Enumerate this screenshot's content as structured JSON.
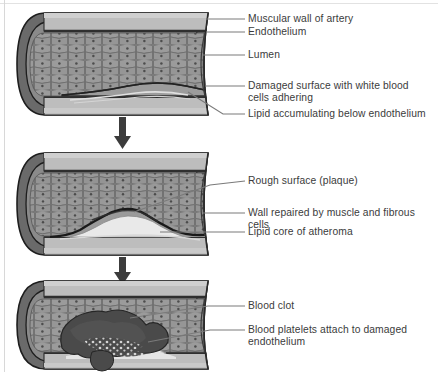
{
  "diagram": {
    "type": "biological-process-diagram",
    "orientation": "vertical-three-stage",
    "colors": {
      "outer_wall_dark": "#5e5e5e",
      "muscular_wall": "#b6b6b6",
      "muscular_wall_light": "#c9c9c9",
      "endothelium_dark": "#3a3a3a",
      "lumen_cells": "#8f8f8f",
      "lumen_cell_outline": "#6d6d6d",
      "lipid_core": "#e6e6e6",
      "blood_clot": "#4a4a4a",
      "platelets": "#d0d0d0",
      "leader_line": "#7a7a7a",
      "text": "#3b3b3b",
      "arrow": "#3c3c3c",
      "background": "#ffffff"
    },
    "stages": [
      {
        "id": "stage-1",
        "order": 1,
        "name": "early-damage",
        "labels": [
          {
            "id": "label-muscular-wall",
            "text": "Muscular wall of artery",
            "x": 248,
            "y": 13
          },
          {
            "id": "label-endothelium",
            "text": "Endothelium",
            "x": 248,
            "y": 28
          },
          {
            "id": "label-lumen",
            "text": "Lumen",
            "x": 248,
            "y": 50
          },
          {
            "id": "label-damaged-surface",
            "text": "Damaged surface with white blood\ncells adhering",
            "x": 248,
            "y": 80
          },
          {
            "id": "label-lipid-accumulating",
            "text": "Lipid accumulating below endothelium",
            "x": 248,
            "y": 112
          }
        ]
      },
      {
        "id": "stage-2",
        "order": 2,
        "name": "plaque-formation",
        "labels": [
          {
            "id": "label-rough-surface",
            "text": "Rough surface (plaque)",
            "x": 248,
            "y": 179
          },
          {
            "id": "label-wall-repaired",
            "text": "Wall repaired by muscle and fibrous cells",
            "x": 248,
            "y": 209
          },
          {
            "id": "label-lipid-core",
            "text": "Lipid core of atheroma",
            "x": 248,
            "y": 230
          }
        ]
      },
      {
        "id": "stage-3",
        "order": 3,
        "name": "thrombus-formation",
        "labels": [
          {
            "id": "label-blood-clot",
            "text": "Blood clot",
            "x": 248,
            "y": 306
          },
          {
            "id": "label-blood-platelets",
            "text": "Blood platelets attach to damaged\nendothelium",
            "x": 248,
            "y": 330
          }
        ]
      }
    ],
    "arrows": [
      {
        "id": "arrow-stage1-to-stage2",
        "label": "progression-arrow-1"
      },
      {
        "id": "arrow-stage2-to-stage3",
        "label": "progression-arrow-2"
      }
    ]
  }
}
